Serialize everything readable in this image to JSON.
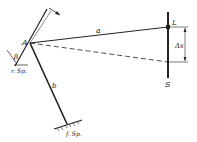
{
  "diagram": {
    "labels": {
      "point_a": "A",
      "distance_a": "a",
      "distance_b": "b",
      "angle_beta": "β",
      "lamp": "L",
      "scale": "S",
      "delta_s": "Δs",
      "movable_mirror": "r. Sp.",
      "fixed_mirror": "f. Sp."
    },
    "colors": {
      "ink": "#222222",
      "background": "#ffffff"
    }
  }
}
